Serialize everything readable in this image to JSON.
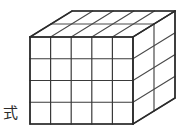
{
  "figure": {
    "kind": "oblique-projection-cube-grid",
    "title": "",
    "annotation_label": "式",
    "annotation_position": {
      "x": 3,
      "y": 101
    },
    "colors": {
      "background": "#ffffff",
      "front_face_stroke": "#3a3a3a",
      "top_face_stroke": "#4a4a4a",
      "side_face_stroke": "#4a4a4a",
      "outline_stroke": "#2b2b2b",
      "fill": "#ffffff",
      "label_color": "#2b2b2b"
    },
    "stroke_widths": {
      "outline": 1.6,
      "interior": 1.2
    },
    "geometry": {
      "front_left_x": 30,
      "front_right_x": 133,
      "front_top_y": 37,
      "front_bottom_y": 124,
      "depth_step_x": 21,
      "depth_step_y": -13
    },
    "dimensions": {
      "columns": 5,
      "rows": 4,
      "depth": 2,
      "total_cubes": 40
    },
    "front_face_vertical_x": [
      30,
      51,
      72,
      92,
      113,
      133
    ],
    "front_face_horizontal_y": [
      37,
      59,
      81,
      102,
      124
    ]
  }
}
